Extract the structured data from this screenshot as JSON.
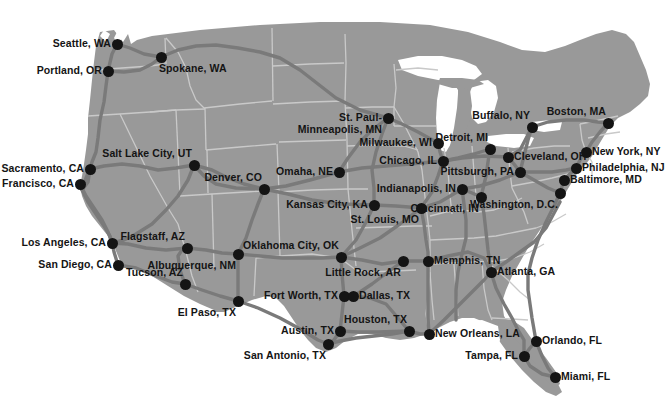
{
  "map": {
    "title": "United States Major Cities Map",
    "colors": {
      "background": "#ffffff",
      "land": "#999999",
      "state_border": "#c9c9c9",
      "highway": "#7a7a7a",
      "water": "#ffffff",
      "city_dot": "#141414",
      "label_text": "#141414"
    },
    "cities": [
      {
        "name": "Seattle, WA",
        "x": 117,
        "y": 44,
        "anchor": "left"
      },
      {
        "name": "Portland, OR",
        "x": 108,
        "y": 71,
        "anchor": "left"
      },
      {
        "name": "Spokane, WA",
        "x": 161,
        "y": 57,
        "anchor": "below"
      },
      {
        "name": "St. Paul-\nMinneapolis, MN",
        "x": 388,
        "y": 118,
        "anchor": "left"
      },
      {
        "name": "Sacramento, CA",
        "x": 90,
        "y": 169,
        "anchor": "left"
      },
      {
        "name": "San Francisco, CA",
        "x": 80,
        "y": 184,
        "anchor": "left"
      },
      {
        "name": "Salt Lake City, UT",
        "x": 194,
        "y": 165,
        "anchor": "above-left"
      },
      {
        "name": "Denver, CO",
        "x": 264,
        "y": 189,
        "anchor": "above-left"
      },
      {
        "name": "Omaha, NE",
        "x": 339,
        "y": 172,
        "anchor": "left"
      },
      {
        "name": "Milwaukee, WI",
        "x": 438,
        "y": 143,
        "anchor": "left"
      },
      {
        "name": "Chicago, IL",
        "x": 443,
        "y": 161,
        "anchor": "left"
      },
      {
        "name": "Detroit, MI",
        "x": 490,
        "y": 149,
        "anchor": "above-left"
      },
      {
        "name": "Buffalo, NY",
        "x": 532,
        "y": 127,
        "anchor": "above-left"
      },
      {
        "name": "Boston, MA",
        "x": 608,
        "y": 123,
        "anchor": "above-left"
      },
      {
        "name": "Cleveland, OH",
        "x": 508,
        "y": 157,
        "anchor": "right"
      },
      {
        "name": "New York, NY",
        "x": 586,
        "y": 152,
        "anchor": "right"
      },
      {
        "name": "Pittsburgh, PA",
        "x": 520,
        "y": 172,
        "anchor": "left"
      },
      {
        "name": "Philadelphia, NJ",
        "x": 576,
        "y": 168,
        "anchor": "right"
      },
      {
        "name": "Baltimore, MD",
        "x": 564,
        "y": 180,
        "anchor": "right"
      },
      {
        "name": "Washington, D.C.",
        "x": 560,
        "y": 193,
        "anchor": "below-left"
      },
      {
        "name": "Indianapolis, IN",
        "x": 462,
        "y": 189,
        "anchor": "left"
      },
      {
        "name": "Cincinnati, IN",
        "x": 481,
        "y": 197,
        "anchor": "below-left"
      },
      {
        "name": "Kansas City, KA",
        "x": 374,
        "y": 205,
        "anchor": "left"
      },
      {
        "name": "St. Louis, MO",
        "x": 421,
        "y": 208,
        "anchor": "below-left"
      },
      {
        "name": "Los Angeles, CA",
        "x": 112,
        "y": 243,
        "anchor": "left"
      },
      {
        "name": "San Diego, CA",
        "x": 118,
        "y": 265,
        "anchor": "left"
      },
      {
        "name": "Flagstaff, AZ",
        "x": 187,
        "y": 248,
        "anchor": "above-left"
      },
      {
        "name": "Albuquerque, NM",
        "x": 238,
        "y": 254,
        "anchor": "below-left"
      },
      {
        "name": "Tucson, AZ",
        "x": 185,
        "y": 284,
        "anchor": "above-left"
      },
      {
        "name": "Oklahoma City, OK",
        "x": 341,
        "y": 257,
        "anchor": "above-left"
      },
      {
        "name": "Little Rock, AR",
        "x": 403,
        "y": 261,
        "anchor": "below-left"
      },
      {
        "name": "Memphis, TN",
        "x": 428,
        "y": 261,
        "anchor": "right"
      },
      {
        "name": "Atlanta, GA",
        "x": 491,
        "y": 272,
        "anchor": "right"
      },
      {
        "name": "El Paso, TX",
        "x": 238,
        "y": 301,
        "anchor": "below-left"
      },
      {
        "name": "Fort Worth, TX",
        "x": 344,
        "y": 296,
        "anchor": "left"
      },
      {
        "name": "Dallas, TX",
        "x": 353,
        "y": 296,
        "anchor": "right"
      },
      {
        "name": "Austin, TX",
        "x": 340,
        "y": 331,
        "anchor": "left"
      },
      {
        "name": "Houston, TX",
        "x": 409,
        "y": 331,
        "anchor": "above-left"
      },
      {
        "name": "San Antonio, TX",
        "x": 328,
        "y": 344,
        "anchor": "below-left"
      },
      {
        "name": "New Orleans, LA",
        "x": 429,
        "y": 334,
        "anchor": "right"
      },
      {
        "name": "Orlando, FL",
        "x": 536,
        "y": 341,
        "anchor": "right"
      },
      {
        "name": "Tampa, FL",
        "x": 524,
        "y": 356,
        "anchor": "left"
      },
      {
        "name": "Miami, FL",
        "x": 555,
        "y": 377,
        "anchor": "right"
      }
    ]
  }
}
